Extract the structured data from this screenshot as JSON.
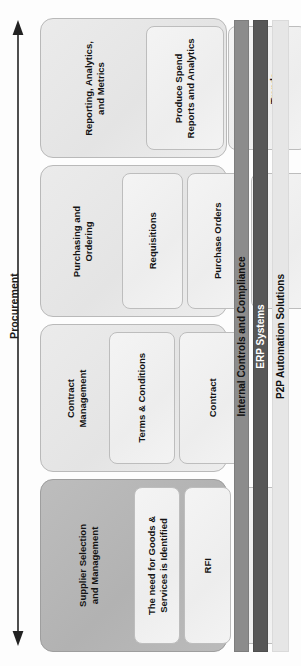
{
  "diagram": {
    "axis": {
      "label": "Procurement",
      "icon": "double-headed-arrow-icon",
      "direction": "vertical-bidirectional"
    },
    "colors": {
      "group_light_bg": "#e9e9e9",
      "group_dark_bg": "#b7b7b7",
      "item_bg": "#f1f1f1",
      "bar_internal_controls": "#8c8c8c",
      "bar_erp": "#575757",
      "bar_p2p": "#e6e6e6",
      "text": "#141414"
    },
    "groups": [
      {
        "id": "reporting-analytics-and-metrics",
        "title": "Reporting, Analytics,\nand Metrics",
        "shade": "light",
        "items": [
          {
            "id": "produce-spend-reports-and-analytics",
            "label": "Produce Spend\nReports and Analytics"
          },
          {
            "id": "track-results-and-trends",
            "label": "Track Results and\nTrends"
          },
          {
            "id": "report",
            "label": "Report"
          },
          {
            "id": "procurement-metrics",
            "label": "Procurement Metrics"
          }
        ]
      },
      {
        "id": "purchasing-and-ordering",
        "title": "Purchasing and\nOrdering",
        "shade": "light",
        "items": [
          {
            "id": "requisitions",
            "label": "Requisitions"
          },
          {
            "id": "purchase-orders",
            "label": "Purchase Orders"
          },
          {
            "id": "e-procurement",
            "label": "E-procurement"
          },
          {
            "id": "po-flip",
            "label": "PO Flip"
          }
        ]
      },
      {
        "id": "contract-management",
        "title": "Contract\nManagement",
        "shade": "light",
        "items": [
          {
            "id": "terms-and-conditions",
            "label": "Terms & Conditions"
          },
          {
            "id": "contract",
            "label": "Contract"
          }
        ]
      },
      {
        "id": "supplier-selection-and-management",
        "title": "Supplier Selection\nand Management",
        "shade": "dark",
        "items": [
          {
            "id": "the-need-for-goods-and-services-is-identified",
            "label": "The need for Goods &\nServices is Identified"
          },
          {
            "id": "rfi",
            "label": "RFI"
          },
          {
            "id": "rfp",
            "label": "RFP"
          }
        ]
      }
    ],
    "bars": [
      {
        "id": "internal-controls-and-compliance",
        "label": "Internal Controls and Compliance"
      },
      {
        "id": "erp-systems",
        "label": "ERP Systems"
      },
      {
        "id": "p2p-automation-solutions",
        "label": "P2P Automation Solutions"
      }
    ]
  }
}
